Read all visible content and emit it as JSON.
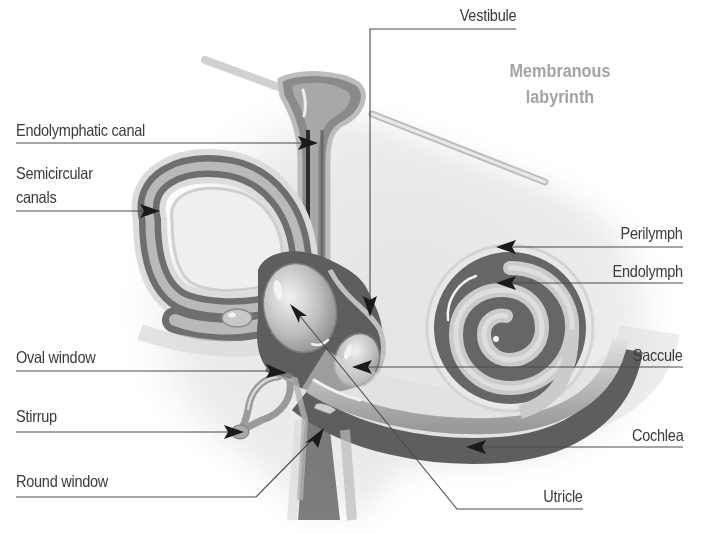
{
  "title": {
    "line1": "Membranous",
    "line2": "labyrinth",
    "color": "#a4a4a4"
  },
  "labels": {
    "left": [
      {
        "id": "endolymphatic-canal",
        "text": "Endolymphatic canal"
      },
      {
        "id": "semicircular-canals",
        "line1": "Semicircular",
        "line2": "canals"
      },
      {
        "id": "oval-window",
        "text": "Oval window"
      },
      {
        "id": "stirrup",
        "text": "Stirrup"
      },
      {
        "id": "round-window",
        "text": "Round window"
      }
    ],
    "right": [
      {
        "id": "vestibule",
        "text": "Vestibule"
      },
      {
        "id": "perilymph",
        "text": "Perilymph"
      },
      {
        "id": "endolymph",
        "text": "Endolymph"
      },
      {
        "id": "saccule",
        "text": "Saccule"
      },
      {
        "id": "cochlea",
        "text": "Cochlea"
      },
      {
        "id": "utricle",
        "text": "Utricle"
      }
    ]
  },
  "colors": {
    "label_text": "#3a3a3a",
    "leader_line": "#4a4a4a",
    "arrowhead": "#1a1a1a",
    "perilymph_dark": "#5a5a5a",
    "endolymph_light": "#c8c8c8",
    "bone_background": "#e8e8e8"
  }
}
